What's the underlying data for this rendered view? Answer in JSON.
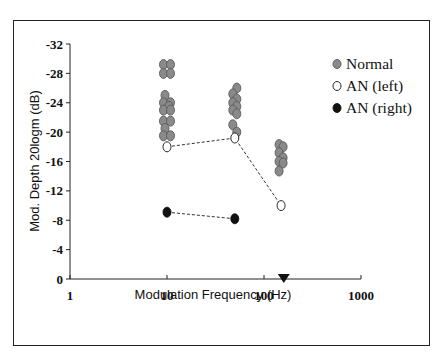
{
  "chart_data": {
    "type": "scatter",
    "title": "",
    "xlabel": "Modulation Frequency (Hz)",
    "ylabel": "Mod. Depth 20logm (dB)",
    "xscale": "log",
    "xlim": [
      1,
      1000
    ],
    "ylim": [
      0,
      -32
    ],
    "x_ticks": [
      "1",
      "10",
      "100",
      "1000"
    ],
    "y_ticks": [
      "0",
      "-4",
      "-8",
      "-12",
      "-16",
      "-20",
      "-24",
      "-28",
      "-32"
    ],
    "grid": false,
    "legend_position": "upper right, outside plot area",
    "series": [
      {
        "name": "Normal",
        "marker": "filled gray circle",
        "color": "#8a8a8a",
        "points": [
          {
            "x": 10,
            "y": -29.2
          },
          {
            "x": 10,
            "y": -29.2
          },
          {
            "x": 10,
            "y": -28.0
          },
          {
            "x": 10,
            "y": -28.0
          },
          {
            "x": 10,
            "y": -25.0
          },
          {
            "x": 10,
            "y": -24.0
          },
          {
            "x": 10,
            "y": -24.0
          },
          {
            "x": 10,
            "y": -23.5
          },
          {
            "x": 10,
            "y": -23.0
          },
          {
            "x": 10,
            "y": -23.0
          },
          {
            "x": 10,
            "y": -21.5
          },
          {
            "x": 10,
            "y": -21.5
          },
          {
            "x": 10,
            "y": -20.5
          },
          {
            "x": 10,
            "y": -19.5
          },
          {
            "x": 10,
            "y": -19.5
          },
          {
            "x": 50,
            "y": -26.0
          },
          {
            "x": 50,
            "y": -25.2
          },
          {
            "x": 50,
            "y": -24.5
          },
          {
            "x": 50,
            "y": -24.0
          },
          {
            "x": 50,
            "y": -23.5
          },
          {
            "x": 50,
            "y": -23.0
          },
          {
            "x": 50,
            "y": -22.5
          },
          {
            "x": 50,
            "y": -21.0
          },
          {
            "x": 50,
            "y": -20.0
          },
          {
            "x": 150,
            "y": -18.3
          },
          {
            "x": 150,
            "y": -18.0
          },
          {
            "x": 150,
            "y": -17.2
          },
          {
            "x": 150,
            "y": -16.5
          },
          {
            "x": 150,
            "y": -16.0
          },
          {
            "x": 150,
            "y": -15.8
          },
          {
            "x": 150,
            "y": -14.7
          }
        ]
      },
      {
        "name": "AN (left)",
        "marker": "open circle",
        "color": "#ffffff",
        "line": "dashed",
        "points": [
          {
            "x": 10,
            "y": -18.0
          },
          {
            "x": 50,
            "y": -19.2
          },
          {
            "x": 150,
            "y": -10.0
          }
        ]
      },
      {
        "name": "AN (right)",
        "marker": "filled black circle",
        "color": "#111111",
        "line": "dashed",
        "points": [
          {
            "x": 10,
            "y": -9.1
          },
          {
            "x": 50,
            "y": -8.2
          }
        ]
      }
    ],
    "annotations": [
      {
        "type": "filled downward triangle",
        "x": 160,
        "y": 0,
        "color": "#111111"
      }
    ]
  }
}
